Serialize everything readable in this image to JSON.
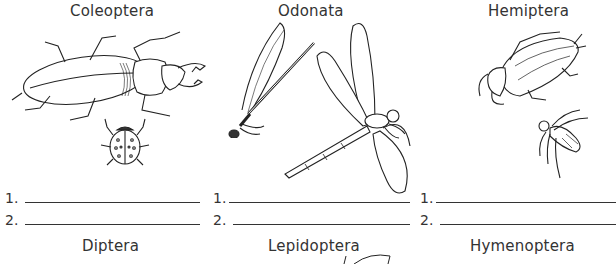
{
  "worksheet": {
    "columns": [
      {
        "order_name": "Coleoptera",
        "illustrations": [
          "stag-beetle",
          "ladybug"
        ],
        "answer_lines": [
          {
            "number": "1."
          },
          {
            "number": "2."
          }
        ]
      },
      {
        "order_name": "Odonata",
        "illustrations": [
          "damselfly",
          "dragonfly"
        ],
        "answer_lines": [
          {
            "number": "1."
          },
          {
            "number": "2."
          }
        ]
      },
      {
        "order_name": "Hemiptera",
        "illustrations": [
          "giant-water-bug",
          "backswimmer"
        ],
        "answer_lines": [
          {
            "number": "1."
          },
          {
            "number": "2."
          }
        ]
      }
    ],
    "next_row_titles": [
      "Diptera",
      "Lepidoptera",
      "Hymenoptera"
    ]
  },
  "colors": {
    "ink": "#222222",
    "background": "#ffffff"
  }
}
